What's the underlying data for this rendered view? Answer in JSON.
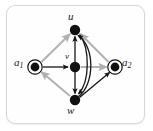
{
  "figure": {
    "kind": "directed-graph-diagram",
    "frame": {
      "border_color": "#d8d8d8",
      "background_color": "#fefefe",
      "corner_radius_px": 9
    },
    "colors": {
      "node_fill": "#111111",
      "node_ring": "#111111",
      "edge_dark": "#151515",
      "edge_gray": "#b0b0b0",
      "label_text": "#1a1a1a"
    },
    "nodes": [
      {
        "id": "u",
        "label": "u",
        "label_base": "u",
        "label_sub": "",
        "x": 75,
        "y": 30,
        "style": "filled",
        "radius": 5.2,
        "label_position": "above"
      },
      {
        "id": "v",
        "label": "v",
        "label_base": "v",
        "label_sub": "",
        "x": 75,
        "y": 67,
        "style": "filled",
        "radius": 5.2,
        "label_position": "above"
      },
      {
        "id": "w",
        "label": "w",
        "label_base": "w",
        "label_sub": "",
        "x": 75,
        "y": 100,
        "style": "filled",
        "radius": 5.2,
        "label_position": "below"
      },
      {
        "id": "a1",
        "label": "a1",
        "label_base": "a",
        "label_sub": "1",
        "x": 35,
        "y": 67,
        "style": "double",
        "radius": 4.4,
        "ring_radius": 7.2,
        "label_position": "left"
      },
      {
        "id": "a2",
        "label": "a2",
        "label_base": "a",
        "label_sub": "2",
        "x": 115,
        "y": 67,
        "style": "double",
        "radius": 4.4,
        "ring_radius": 7.2,
        "label_position": "right"
      }
    ],
    "edges": [
      {
        "from": "a1",
        "to": "u",
        "color": "gray",
        "shape": "straight",
        "arrow": "end"
      },
      {
        "from": "a1",
        "to": "v",
        "color": "dark",
        "shape": "straight",
        "arrow": "end"
      },
      {
        "from": "w",
        "to": "a1",
        "color": "gray",
        "shape": "straight",
        "arrow": "end"
      },
      {
        "from": "a2",
        "to": "u",
        "color": "gray",
        "shape": "straight",
        "arrow": "end"
      },
      {
        "from": "v",
        "to": "a2",
        "color": "gray",
        "shape": "straight",
        "arrow": "end"
      },
      {
        "from": "w",
        "to": "a2",
        "color": "dark",
        "shape": "straight",
        "arrow": "end"
      },
      {
        "from": "v",
        "to": "u",
        "color": "dark",
        "shape": "straight",
        "arrow": "end"
      },
      {
        "from": "v",
        "to": "w",
        "color": "dark",
        "shape": "straight",
        "arrow": "end"
      },
      {
        "from": "w",
        "to": "u",
        "color": "dark",
        "shape": "curve-right-outer",
        "arrow": "end"
      },
      {
        "from": "u",
        "to": "w",
        "color": "dark",
        "shape": "curve-right-inner",
        "arrow": "end"
      }
    ]
  }
}
